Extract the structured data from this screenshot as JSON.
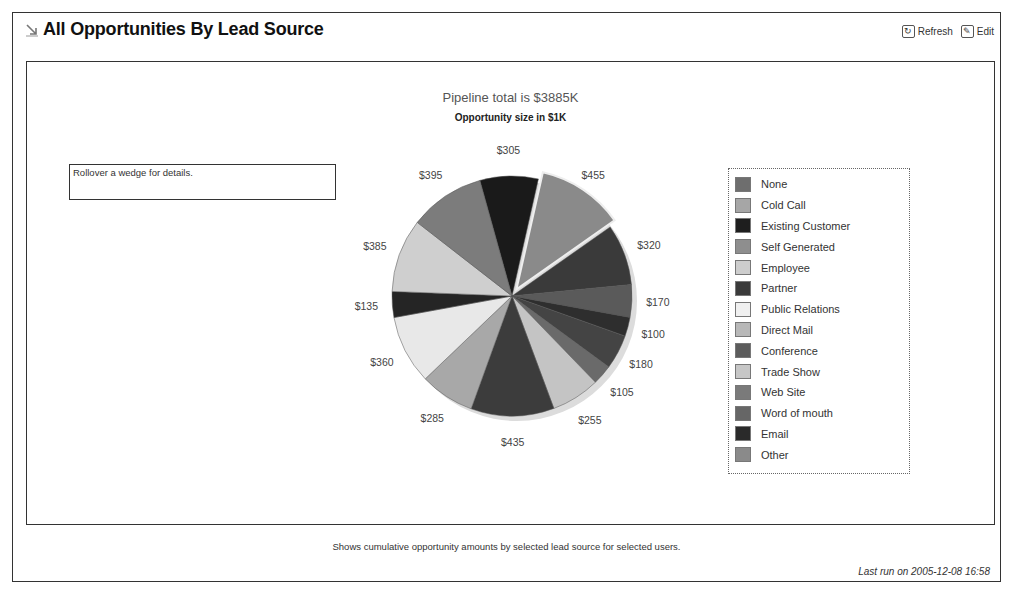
{
  "header": {
    "title": "All Opportunities By Lead Source",
    "title_icon": "arrow-down-right-icon",
    "actions": [
      {
        "label": "Refresh",
        "icon": "refresh-icon"
      },
      {
        "label": "Edit",
        "icon": "edit-icon"
      }
    ]
  },
  "rollover_text": "Rollover a wedge for details.",
  "footer": {
    "description": "Shows cumulative opportunity amounts by selected lead source for selected users.",
    "last_run": "Last run on 2005-12-08 16:58"
  },
  "chart_data": {
    "type": "pie",
    "title": "Pipeline total is $3885K",
    "subtitle": "Opportunity size in $1K",
    "legend_position": "right",
    "categories": [
      "None",
      "Cold Call",
      "Existing Customer",
      "Self Generated",
      "Employee",
      "Partner",
      "Public Relations",
      "Direct Mail",
      "Conference",
      "Trade Show",
      "Web Site",
      "Word of mouth",
      "Email",
      "Other"
    ],
    "slices_clockwise_from_top": [
      {
        "label": "$305",
        "value": 305,
        "color": "#1a1a1a"
      },
      {
        "label": "$455",
        "value": 455,
        "color": "#8a8a8a",
        "exploded": true
      },
      {
        "label": "$320",
        "value": 320,
        "color": "#3a3a3a"
      },
      {
        "label": "$170",
        "value": 170,
        "color": "#5a5a5a"
      },
      {
        "label": "$100",
        "value": 100,
        "color": "#2e2e2e"
      },
      {
        "label": "$180",
        "value": 180,
        "color": "#444444"
      },
      {
        "label": "$105",
        "value": 105,
        "color": "#6a6a6a"
      },
      {
        "label": "$255",
        "value": 255,
        "color": "#c4c4c4"
      },
      {
        "label": "$435",
        "value": 435,
        "color": "#3c3c3c"
      },
      {
        "label": "$285",
        "value": 285,
        "color": "#a8a8a8"
      },
      {
        "label": "$360",
        "value": 360,
        "color": "#e8e8e8"
      },
      {
        "label": "$135",
        "value": 135,
        "color": "#252525"
      },
      {
        "label": "$385",
        "value": 385,
        "color": "#cfcfcf"
      },
      {
        "label": "$395",
        "value": 395,
        "color": "#7c7c7c"
      }
    ],
    "legend_colors": [
      "#6e6e6e",
      "#a6a6a6",
      "#1e1e1e",
      "#8e8e8e",
      "#cdcdcd",
      "#3a3a3a",
      "#f0f0f0",
      "#b8b8b8",
      "#5c5c5c",
      "#c6c6c6",
      "#7a7a7a",
      "#666666",
      "#2a2a2a",
      "#8a8a8a"
    ],
    "total": "$3885K"
  }
}
